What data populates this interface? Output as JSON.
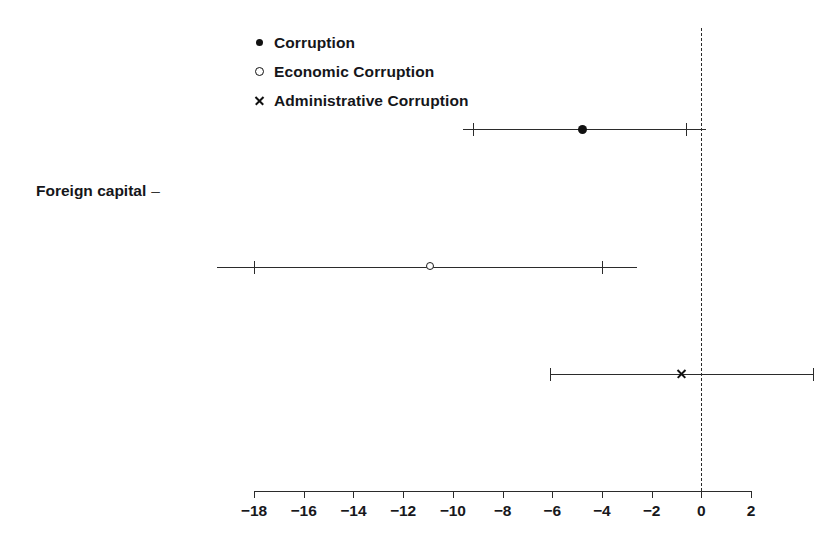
{
  "chart_data": {
    "type": "scatter",
    "title": "",
    "subtitle": "",
    "xlabel": "",
    "ylabel": "Foreign capital",
    "categories": [
      "Foreign capital"
    ],
    "xlim": [
      -18,
      2
    ],
    "xticks": [
      -18,
      -16,
      -14,
      -12,
      -10,
      -8,
      -6,
      -4,
      -2,
      0,
      2
    ],
    "xticklabels": [
      "−18",
      "−16",
      "−14",
      "−12",
      "−10",
      "−8",
      "−6",
      "−4",
      "−2",
      "0",
      "2"
    ],
    "grid": false,
    "reference_line": {
      "x": 0,
      "style": "dashed"
    },
    "legend_position": "top-left",
    "series": [
      {
        "name": "Corruption",
        "marker": "filled-circle",
        "estimate": -4.8,
        "ci_low": -9.2,
        "ci_high": -0.6,
        "whisker_low": -9.6,
        "whisker_high": 0.2
      },
      {
        "name": "Economic Corruption",
        "marker": "open-circle",
        "estimate": -10.9,
        "ci_low": -18.0,
        "ci_high": -4.0,
        "whisker_low": -19.5,
        "whisker_high": -2.6
      },
      {
        "name": "Administrative Corruption",
        "marker": "cross",
        "estimate": -0.8,
        "ci_low": -6.1,
        "ci_high": 4.5,
        "whisker_low": -6.1,
        "whisker_high": 4.5
      }
    ]
  },
  "legend": {
    "items": [
      {
        "label": "Corruption",
        "marker": "filled-circle-icon"
      },
      {
        "label": "Economic Corruption",
        "marker": "open-circle-icon"
      },
      {
        "label": "Administrative Corruption",
        "marker": "cross-icon"
      }
    ]
  },
  "axis": {
    "y_category_label": "Foreign capital",
    "y_tick_dash": "–"
  },
  "colors": {
    "ink": "#111111",
    "axis": "#2b2b2b",
    "background": "#ffffff"
  }
}
